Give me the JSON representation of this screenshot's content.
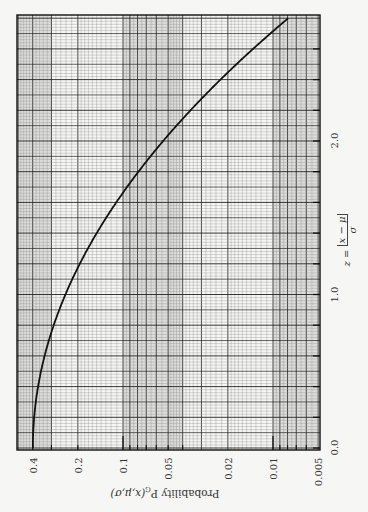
{
  "chart_data": {
    "type": "line",
    "title": "",
    "orientation": "rotated-90deg (z axis runs bottom-to-top along the page, probability axis left-to-right)",
    "xlabel": "z = |x − μ| / σ",
    "xlabel_parts": {
      "lhs": "z =",
      "numerator": "x − μ",
      "denominator": "σ"
    },
    "ylabel": "Probability P_G(x,μ,σ)",
    "ylabel_parts": {
      "main": "Probability P",
      "sub": "G",
      "args": "(x,μ,σ)"
    },
    "xscale": "linear",
    "yscale": "log",
    "xlim": [
      0,
      2.8
    ],
    "ylim": [
      0.005,
      0.5
    ],
    "x_tick_labels": [
      {
        "value": 0.0,
        "label": "0.0"
      },
      {
        "value": 1.0,
        "label": "1.0"
      },
      {
        "value": 2.0,
        "label": "2.0"
      }
    ],
    "x_minor_ticks": [
      0.2,
      0.4,
      0.6,
      0.8,
      1.2,
      1.4,
      1.6,
      1.8,
      2.2,
      2.4,
      2.6
    ],
    "y_tick_labels": [
      {
        "value": 0.4,
        "label": "0.4"
      },
      {
        "value": 0.2,
        "label": "0.2"
      },
      {
        "value": 0.1,
        "label": "0.1"
      },
      {
        "value": 0.05,
        "label": "0.05"
      },
      {
        "value": 0.02,
        "label": "0.02"
      },
      {
        "value": 0.01,
        "label": "0.01"
      },
      {
        "value": 0.005,
        "label": "0.005"
      }
    ],
    "grid": true,
    "series": [
      {
        "name": "Gaussian probability density P_G(z)",
        "x": [
          0.0,
          0.2,
          0.4,
          0.6,
          0.8,
          1.0,
          1.2,
          1.4,
          1.6,
          1.8,
          2.0,
          2.2,
          2.4,
          2.6,
          2.8
        ],
        "values": [
          0.399,
          0.391,
          0.368,
          0.333,
          0.29,
          0.242,
          0.194,
          0.15,
          0.111,
          0.079,
          0.054,
          0.036,
          0.022,
          0.014,
          0.0079
        ]
      }
    ]
  },
  "colors": {
    "background": "#f6f6f4",
    "grid_fine": "#8a8a8a",
    "grid_major": "#222222",
    "band_shade": "#c8c8c8",
    "curve": "#111111"
  }
}
